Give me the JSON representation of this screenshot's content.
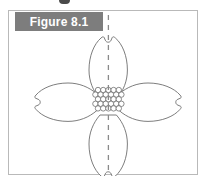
{
  "figure": {
    "label": "Figure 8.1",
    "label_bar_color": "#7d7d7d",
    "label_text_color": "#ffffff",
    "border_color": "#b9b9b9",
    "background_color": "#ffffff"
  },
  "illustration": {
    "subject": "four-petal dogwood flower with vertical line of symmetry",
    "outline_color": "#6e6e6e",
    "petal_fill": "#ffffff",
    "petal_count": 4,
    "petals": [
      {
        "name": "top-petal",
        "position": "top",
        "notch": "tip-notch"
      },
      {
        "name": "right-petal",
        "position": "right",
        "notch": "tip-notch"
      },
      {
        "name": "bottom-petal",
        "position": "bottom",
        "notch": "tip-notch"
      },
      {
        "name": "left-petal",
        "position": "left",
        "notch": "tip-notch"
      }
    ],
    "center": {
      "name": "stamen-cluster",
      "shape": "hexagonal packed circles",
      "circle_count": 26,
      "circle_color": "#6e6e6e"
    },
    "symmetry_line": {
      "name": "vertical-dashed-symmetry-line",
      "orientation": "vertical",
      "style": "dashed",
      "color": "#8a8a8a",
      "x": 99,
      "y_start": 4,
      "y_end": 161
    }
  }
}
